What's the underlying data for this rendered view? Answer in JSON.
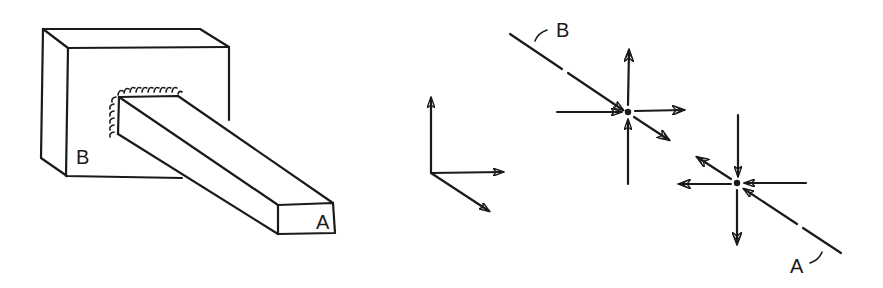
{
  "figure": {
    "left_panel": {
      "description": "Cantilever beam fixed in a support block",
      "wall_label": "B",
      "free_end_label": "A"
    },
    "axes_triad": {
      "description": "Coordinate axes sketch (three axes)"
    },
    "right_panel": {
      "description": "Force and moment vectors at points along the beam axis",
      "line_end_label_top": "B",
      "line_end_label_bottom": "A"
    }
  }
}
